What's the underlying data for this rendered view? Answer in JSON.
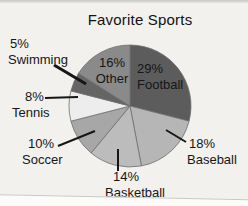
{
  "title": "Favorite Sports",
  "chart_data": {
    "type": "pie",
    "title": "Favorite Sports",
    "unit": "%",
    "start_angle_deg": 0,
    "direction": "clockwise",
    "legend": "none",
    "slices": [
      {
        "label": "Football",
        "value": 29,
        "display": "29%",
        "color": "#5c5c5c",
        "label_placement": "inside"
      },
      {
        "label": "Baseball",
        "value": 18,
        "display": "18%",
        "color": "#b6b6b6",
        "label_placement": "outside-right"
      },
      {
        "label": "Basketball",
        "value": 14,
        "display": "14%",
        "color": "#bcbcbc",
        "label_placement": "outside-bottom"
      },
      {
        "label": "Soccer",
        "value": 10,
        "display": "10%",
        "color": "#a7a7a7",
        "label_placement": "outside-left"
      },
      {
        "label": "Tennis",
        "value": 8,
        "display": "8%",
        "color": "#eeeded",
        "label_placement": "outside-left"
      },
      {
        "label": "Swimming",
        "value": 5,
        "display": "5%",
        "color": "#656565",
        "label_placement": "outside-left"
      },
      {
        "label": "Other",
        "value": 16,
        "display": "16%",
        "color": "#8a8a8a",
        "label_placement": "inside"
      }
    ]
  }
}
